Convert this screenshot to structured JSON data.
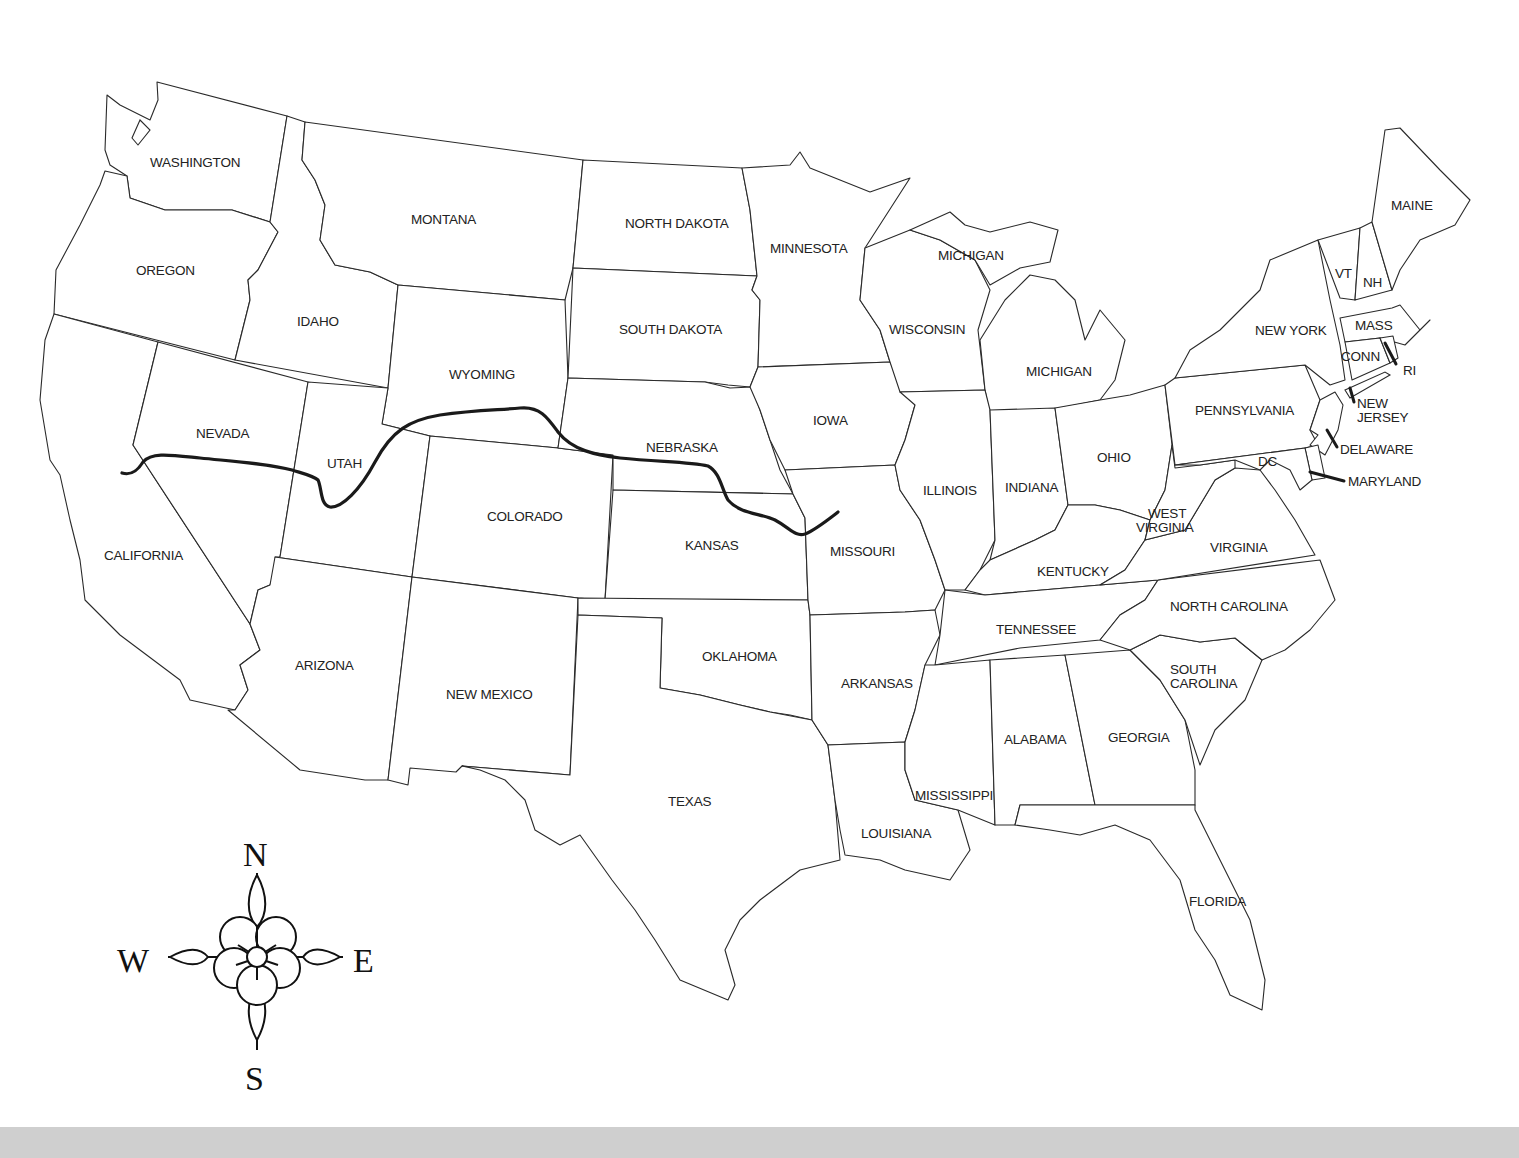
{
  "map": {
    "title": "United States map with route line",
    "colors": {
      "background": "#ffffff",
      "border": "#2a2a2a",
      "route": "#1a1a1a",
      "bottom_band": "#cfcfcf"
    },
    "states": {
      "washington": "WASHINGTON",
      "oregon": "OREGON",
      "california": "CALIFORNIA",
      "idaho": "IDAHO",
      "nevada": "NEVADA",
      "montana": "MONTANA",
      "wyoming": "WYOMING",
      "utah": "UTAH",
      "arizona": "ARIZONA",
      "colorado": "COLORADO",
      "new_mexico": "NEW MEXICO",
      "north_dakota": "NORTH DAKOTA",
      "south_dakota": "SOUTH DAKOTA",
      "nebraska": "NEBRASKA",
      "kansas": "KANSAS",
      "oklahoma": "OKLAHOMA",
      "texas": "TEXAS",
      "minnesota": "MINNESOTA",
      "iowa": "IOWA",
      "missouri": "MISSOURI",
      "arkansas": "ARKANSAS",
      "louisiana": "LOUISIANA",
      "wisconsin": "WISCONSIN",
      "michigan_upper": "MICHIGAN",
      "michigan_lower": "MICHIGAN",
      "illinois": "ILLINOIS",
      "indiana": "INDIANA",
      "ohio": "OHIO",
      "kentucky": "KENTUCKY",
      "tennessee": "TENNESSEE",
      "mississippi": "MISSISSIPPI",
      "alabama": "ALABAMA",
      "georgia": "GEORGIA",
      "florida": "FLORIDA",
      "south_carolina_1": "SOUTH",
      "south_carolina_2": "CAROLINA",
      "north_carolina": "NORTH CAROLINA",
      "virginia": "VIRGINIA",
      "west_virginia_1": "WEST",
      "west_virginia_2": "VIRGINIA",
      "pennsylvania": "PENNSYLVANIA",
      "new_york": "NEW YORK",
      "vermont": "VT",
      "new_hampshire": "NH",
      "maine": "MAINE",
      "massachusetts": "MASS",
      "connecticut": "CONN",
      "rhode_island": "RI",
      "new_jersey_1": "NEW",
      "new_jersey_2": "JERSEY",
      "delaware": "DELAWARE",
      "maryland": "MARYLAND",
      "dc": "DC"
    },
    "compass": {
      "north": "N",
      "south": "S",
      "east": "E",
      "west": "W"
    },
    "route": {
      "description": "Thick route line from central California east through Nevada, Utah, Wyoming, Nebraska, Kansas to western Missouri"
    }
  }
}
